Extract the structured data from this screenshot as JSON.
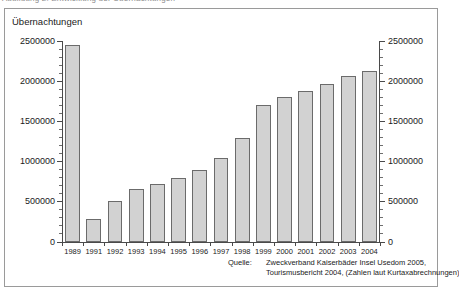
{
  "page": {
    "top_clipped_text": "Abbildung 2: Entwicklung der Übernachtungen"
  },
  "chart_data": {
    "type": "bar",
    "title": "Übernachtungen",
    "xlabel": "",
    "ylabel": "",
    "categories": [
      "1989",
      "1991",
      "1992",
      "1993",
      "1994",
      "1995",
      "1996",
      "1997",
      "1998",
      "1999",
      "2000",
      "2001",
      "2002",
      "2003",
      "2004"
    ],
    "values": [
      2450000,
      285000,
      510000,
      655000,
      725000,
      790000,
      890000,
      1050000,
      1290000,
      1700000,
      1800000,
      1880000,
      1960000,
      2060000,
      2130000
    ],
    "ylim": [
      0,
      2500000
    ],
    "ytick_values": [
      0,
      500000,
      1000000,
      1500000,
      2000000,
      2500000
    ],
    "ytick_labels_left": [
      "0",
      "500000",
      "1000000",
      "1500000",
      "2000000",
      "2500000"
    ],
    "ytick_labels_right": [
      "0",
      "500000",
      "1000000",
      "1500000",
      "2000000",
      "2500000"
    ],
    "minor_tick_step": 100000,
    "grid": false,
    "legend": null,
    "bar_fill_color": "#d2d2d2",
    "bar_border_color": "#6b6b6b",
    "axis_color": "#4a4a4a",
    "dual_axis": true
  },
  "source": {
    "label": "Quelle:",
    "line1": "Zweckverband Kaiserbäder Insel Usedom 2005,",
    "line2": "Tourismusbericht 2004, (Zahlen laut Kurtaxabrechnungen)"
  }
}
